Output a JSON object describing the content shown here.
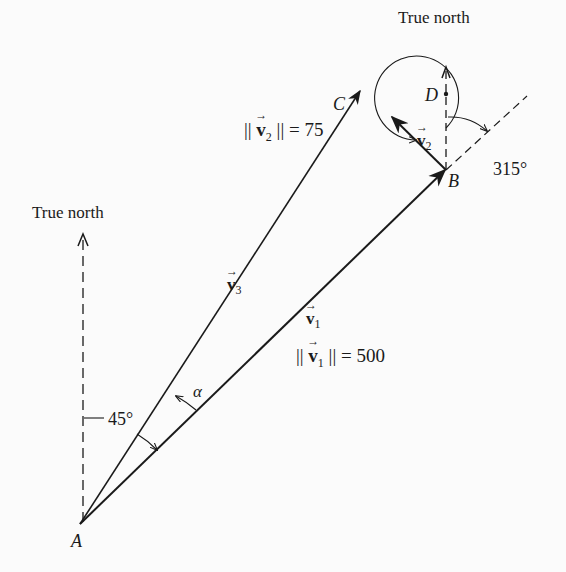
{
  "diagram": {
    "north_label_left": "True north",
    "north_label_right": "True north",
    "points": {
      "A": "A",
      "B": "B",
      "C": "C",
      "D": "D"
    },
    "vectors": {
      "v1": {
        "name": "v",
        "sub": "1",
        "magnitude_label": "|| v₁ || = 500",
        "norm_prefix": "||",
        "norm_suffix": "|| = 500"
      },
      "v2": {
        "name": "v",
        "sub": "2",
        "norm_prefix": "||",
        "norm_suffix": "|| = 75"
      },
      "v3": {
        "name": "v",
        "sub": "3"
      }
    },
    "angles": {
      "a45": "45°",
      "a315": "315°",
      "alpha": "α"
    }
  }
}
